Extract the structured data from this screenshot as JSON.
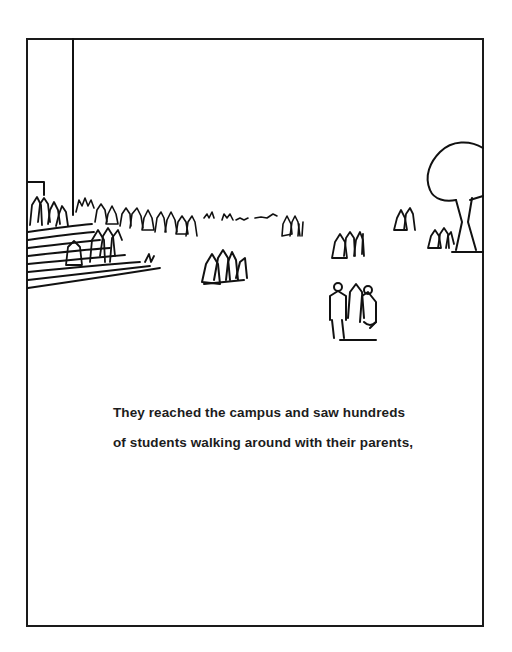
{
  "page": {
    "background": "#ffffff",
    "frame_color": "#1a1a1a",
    "ink_color": "#111111"
  },
  "illustration": {
    "description": "Line drawing of a college campus quad with a flagpole, steps on the left crowded with people, groups of students and parents walking across the lawn, and a tree at the right edge",
    "elements": [
      "flagpole",
      "campus-steps",
      "crowd-on-steps",
      "distant-crowd",
      "student-group-center-left",
      "student-group-center",
      "student-group-center-right",
      "student-group-foreground",
      "student-group-right",
      "tree"
    ]
  },
  "caption": {
    "lines": [
      "They reached the campus and saw hundreds",
      "of students walking around with their parents,"
    ]
  }
}
